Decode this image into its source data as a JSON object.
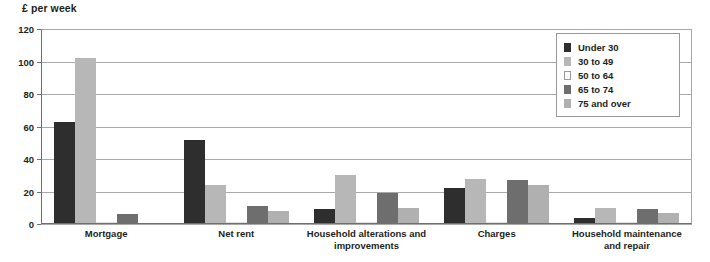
{
  "chart_data": {
    "type": "bar",
    "title": "",
    "xlabel": "",
    "ylabel": "£ per week",
    "ylim": [
      0,
      120
    ],
    "yticks": [
      0,
      20,
      40,
      60,
      80,
      100,
      120
    ],
    "grid": true,
    "legend_position": "top-right",
    "categories": [
      "Mortgage",
      "Net rent",
      "Household alterations and improvements",
      "Charges",
      "Household maintenance and repair"
    ],
    "series": [
      {
        "name": "Under 30",
        "color": "#2e2e2e",
        "values": [
          63,
          52,
          9,
          22,
          4
        ]
      },
      {
        "name": "30 to 49",
        "color": "#b7b7b7",
        "values": [
          102,
          24,
          30,
          28,
          10
        ]
      },
      {
        "name": "50 to 64",
        "color": "#fbfbfb",
        "values": [
          0.6,
          0.5,
          0.5,
          0.5,
          0.4
        ]
      },
      {
        "name": "65 to 74",
        "color": "#6e6e6e",
        "values": [
          6,
          11,
          19,
          27,
          9
        ]
      },
      {
        "name": "75 and over",
        "color": "#b0b0b0",
        "values": [
          0.8,
          8,
          10,
          24,
          7
        ]
      }
    ]
  },
  "axis": {
    "y_title": "£ per week",
    "tick_labels": [
      "0",
      "20",
      "40",
      "60",
      "80",
      "100",
      "120"
    ]
  },
  "categories_display": [
    {
      "line1": "Mortgage",
      "line2": ""
    },
    {
      "line1": "Net rent",
      "line2": ""
    },
    {
      "line1": "Household alterations and",
      "line2": "improvements"
    },
    {
      "line1": "Charges",
      "line2": ""
    },
    {
      "line1": "Household maintenance",
      "line2": "and repair"
    }
  ],
  "legend": {
    "items": [
      {
        "label": "Under 30",
        "color": "#2e2e2e"
      },
      {
        "label": "30 to 49",
        "color": "#b7b7b7"
      },
      {
        "label": "50 to 64",
        "color": "#fbfbfb"
      },
      {
        "label": "65 to 74",
        "color": "#6e6e6e"
      },
      {
        "label": "75 and over",
        "color": "#b0b0b0"
      }
    ]
  },
  "colors": {
    "grid": "#a9a9a9",
    "axis": "#6f6f6f",
    "text": "#231f20",
    "background": "#ffffff",
    "legend_border": "#9a9a9a"
  }
}
